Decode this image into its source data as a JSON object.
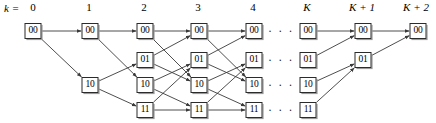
{
  "diagram": {
    "title_label": "k =",
    "type": "trellis",
    "stroke_color": "#3a3a3a",
    "node_border_color": "#2b2b2b",
    "node_fill_color": "#ffffff",
    "background_color": "#ffffff",
    "ellipsis_text": "· · ·",
    "columns": [
      {
        "id": "c0",
        "label": "0",
        "italic_label": false,
        "x": 33,
        "label_x": 33
      },
      {
        "id": "c1",
        "label": "1",
        "italic_label": false,
        "x": 90,
        "label_x": 89
      },
      {
        "id": "c2",
        "label": "2",
        "italic_label": false,
        "x": 145,
        "label_x": 144
      },
      {
        "id": "c3",
        "label": "3",
        "italic_label": false,
        "x": 199,
        "label_x": 198
      },
      {
        "id": "c4",
        "label": "4",
        "italic_label": false,
        "x": 254,
        "label_x": 253
      },
      {
        "id": "cd",
        "label": "",
        "italic_label": false,
        "x": 281,
        "label_x": 281
      },
      {
        "id": "cK",
        "label": "K",
        "italic_label": true,
        "x": 308,
        "label_x": 307
      },
      {
        "id": "cK1",
        "label": "K + 1",
        "italic_label": true,
        "x": 363,
        "label_x": 362
      },
      {
        "id": "cK2",
        "label": "K + 2",
        "italic_label": true,
        "x": 418,
        "label_x": 416
      }
    ],
    "rows": [
      {
        "id": "s00",
        "state": "00",
        "y": 31
      },
      {
        "id": "s01",
        "state": "01",
        "y": 60
      },
      {
        "id": "s10",
        "state": "10",
        "y": 85
      },
      {
        "id": "s11",
        "state": "11",
        "y": 110
      }
    ],
    "nodes": [
      {
        "col": "c0",
        "row": "s00",
        "state": "00"
      },
      {
        "col": "c1",
        "row": "s00",
        "state": "00"
      },
      {
        "col": "c1",
        "row": "s10",
        "state": "10"
      },
      {
        "col": "c2",
        "row": "s00",
        "state": "00"
      },
      {
        "col": "c2",
        "row": "s01",
        "state": "01"
      },
      {
        "col": "c2",
        "row": "s10",
        "state": "10"
      },
      {
        "col": "c2",
        "row": "s11",
        "state": "11"
      },
      {
        "col": "c3",
        "row": "s00",
        "state": "00"
      },
      {
        "col": "c3",
        "row": "s01",
        "state": "01"
      },
      {
        "col": "c3",
        "row": "s10",
        "state": "10"
      },
      {
        "col": "c3",
        "row": "s11",
        "state": "11"
      },
      {
        "col": "c4",
        "row": "s00",
        "state": "00"
      },
      {
        "col": "c4",
        "row": "s01",
        "state": "01"
      },
      {
        "col": "c4",
        "row": "s10",
        "state": "10"
      },
      {
        "col": "c4",
        "row": "s11",
        "state": "11"
      },
      {
        "col": "cK",
        "row": "s00",
        "state": "00"
      },
      {
        "col": "cK",
        "row": "s01",
        "state": "01"
      },
      {
        "col": "cK",
        "row": "s10",
        "state": "10"
      },
      {
        "col": "cK",
        "row": "s11",
        "state": "11"
      },
      {
        "col": "cK1",
        "row": "s00",
        "state": "00"
      },
      {
        "col": "cK1",
        "row": "s01",
        "state": "01"
      },
      {
        "col": "cK2",
        "row": "s00",
        "state": "00"
      }
    ],
    "ellipsis_cells": [
      {
        "col": "cd",
        "row": "s00"
      },
      {
        "col": "cd",
        "row": "s01"
      },
      {
        "col": "cd",
        "row": "s10"
      },
      {
        "col": "cd",
        "row": "s11"
      }
    ],
    "edges": [
      {
        "from_col": "c0",
        "from_row": "s00",
        "to_col": "c1",
        "to_row": "s00"
      },
      {
        "from_col": "c0",
        "from_row": "s00",
        "to_col": "c1",
        "to_row": "s10"
      },
      {
        "from_col": "c1",
        "from_row": "s00",
        "to_col": "c2",
        "to_row": "s00"
      },
      {
        "from_col": "c1",
        "from_row": "s00",
        "to_col": "c2",
        "to_row": "s10"
      },
      {
        "from_col": "c1",
        "from_row": "s10",
        "to_col": "c2",
        "to_row": "s01"
      },
      {
        "from_col": "c1",
        "from_row": "s10",
        "to_col": "c2",
        "to_row": "s11"
      },
      {
        "from_col": "c2",
        "from_row": "s00",
        "to_col": "c3",
        "to_row": "s00"
      },
      {
        "from_col": "c2",
        "from_row": "s00",
        "to_col": "c3",
        "to_row": "s10"
      },
      {
        "from_col": "c2",
        "from_row": "s01",
        "to_col": "c3",
        "to_row": "s00"
      },
      {
        "from_col": "c2",
        "from_row": "s01",
        "to_col": "c3",
        "to_row": "s10"
      },
      {
        "from_col": "c2",
        "from_row": "s10",
        "to_col": "c3",
        "to_row": "s01"
      },
      {
        "from_col": "c2",
        "from_row": "s10",
        "to_col": "c3",
        "to_row": "s11"
      },
      {
        "from_col": "c2",
        "from_row": "s11",
        "to_col": "c3",
        "to_row": "s01"
      },
      {
        "from_col": "c2",
        "from_row": "s11",
        "to_col": "c3",
        "to_row": "s11"
      },
      {
        "from_col": "c3",
        "from_row": "s00",
        "to_col": "c4",
        "to_row": "s00"
      },
      {
        "from_col": "c3",
        "from_row": "s00",
        "to_col": "c4",
        "to_row": "s10"
      },
      {
        "from_col": "c3",
        "from_row": "s01",
        "to_col": "c4",
        "to_row": "s00"
      },
      {
        "from_col": "c3",
        "from_row": "s01",
        "to_col": "c4",
        "to_row": "s10"
      },
      {
        "from_col": "c3",
        "from_row": "s10",
        "to_col": "c4",
        "to_row": "s01"
      },
      {
        "from_col": "c3",
        "from_row": "s10",
        "to_col": "c4",
        "to_row": "s11"
      },
      {
        "from_col": "c3",
        "from_row": "s11",
        "to_col": "c4",
        "to_row": "s01"
      },
      {
        "from_col": "c3",
        "from_row": "s11",
        "to_col": "c4",
        "to_row": "s11"
      },
      {
        "from_col": "cK",
        "from_row": "s00",
        "to_col": "cK1",
        "to_row": "s00"
      },
      {
        "from_col": "cK",
        "from_row": "s01",
        "to_col": "cK1",
        "to_row": "s00"
      },
      {
        "from_col": "cK",
        "from_row": "s10",
        "to_col": "cK1",
        "to_row": "s01"
      },
      {
        "from_col": "cK",
        "from_row": "s11",
        "to_col": "cK1",
        "to_row": "s01"
      },
      {
        "from_col": "cK1",
        "from_row": "s00",
        "to_col": "cK2",
        "to_row": "s00"
      },
      {
        "from_col": "cK1",
        "from_row": "s01",
        "to_col": "cK2",
        "to_row": "s00"
      }
    ]
  }
}
